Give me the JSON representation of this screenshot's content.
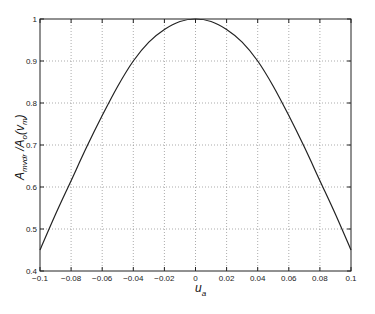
{
  "chart_data": {
    "type": "line",
    "title": "",
    "xlabel": "u_a",
    "ylabel": "A_mvdr / A_o(v_m)",
    "xlim": [
      -0.1,
      0.1
    ],
    "ylim": [
      0.4,
      1.0
    ],
    "grid": true,
    "legend": null,
    "x_ticks": [
      "-0.1",
      "-0.08",
      "-0.06",
      "-0.04",
      "-0.02",
      "0",
      "0.02",
      "0.04",
      "0.06",
      "0.08",
      "0.1"
    ],
    "y_ticks": [
      "0.4",
      "0.5",
      "0.6",
      "0.7",
      "0.8",
      "0.9",
      "1"
    ],
    "series": [
      {
        "name": "A_mvdr/A_o(v_m)",
        "x": [
          -0.1,
          -0.09,
          -0.08,
          -0.07,
          -0.06,
          -0.05,
          -0.04,
          -0.03,
          -0.02,
          -0.01,
          0,
          0.01,
          0.02,
          0.03,
          0.04,
          0.05,
          0.06,
          0.07,
          0.08,
          0.09,
          0.1
        ],
        "y": [
          0.45,
          0.535,
          0.615,
          0.695,
          0.77,
          0.84,
          0.9,
          0.945,
          0.975,
          0.994,
          1.0,
          0.994,
          0.975,
          0.945,
          0.9,
          0.84,
          0.77,
          0.695,
          0.615,
          0.535,
          0.45
        ]
      }
    ]
  },
  "axes": {
    "xlabel_main": "u",
    "xlabel_sub": "a",
    "ylabel_main1": "A",
    "ylabel_sub1": "mvdr",
    "ylabel_mid": " /A",
    "ylabel_sub2": "o",
    "ylabel_tail": "(v",
    "ylabel_sub3": "m",
    "ylabel_close": ")"
  }
}
